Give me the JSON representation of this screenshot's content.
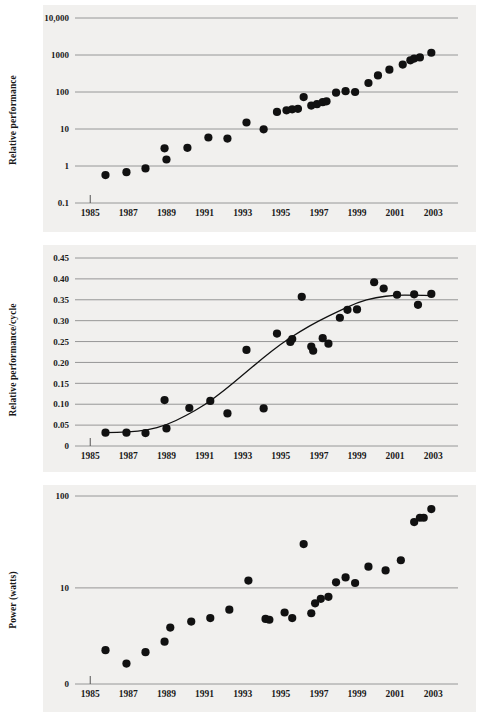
{
  "figure": {
    "background": "#ffffff",
    "panel_background": "#f1f0ee",
    "grid_color": "#8c8c8c",
    "marker_color": "#111111",
    "curve_color": "#111111",
    "panels": 3
  },
  "chart_data": [
    {
      "id": "relative-performance",
      "type": "scatter",
      "title": "",
      "xlabel": "",
      "ylabel": "Relative performance",
      "yscale": "log",
      "ylim": [
        0.1,
        10000
      ],
      "xlim": [
        1984.2,
        2004.3
      ],
      "grid": true,
      "legend": null,
      "ytick_labels": [
        "10,000",
        "1000",
        "100",
        "10",
        "1",
        "0.1"
      ],
      "ytick_values": [
        10000,
        1000,
        100,
        10,
        1,
        0.1
      ],
      "xtick_labels": [
        "1985",
        "1987",
        "1989",
        "1991",
        "1993",
        "1995",
        "1997",
        "1999",
        "2001",
        "2003"
      ],
      "xtick_values": [
        1985,
        1987,
        1989,
        1991,
        1993,
        1995,
        1997,
        1999,
        2001,
        2003
      ],
      "x": [
        1985.8,
        1986.9,
        1987.9,
        1988.9,
        1989.0,
        1990.1,
        1991.2,
        1992.2,
        1993.2,
        1994.1,
        1994.8,
        1995.3,
        1995.6,
        1995.9,
        1996.2,
        1996.6,
        1996.9,
        1997.2,
        1997.4,
        1997.9,
        1998.4,
        1998.9,
        1999.6,
        2000.1,
        2000.7,
        2001.4,
        2001.8,
        2002.0,
        2002.3,
        2002.9
      ],
      "y": [
        0.57,
        0.68,
        0.86,
        3.0,
        1.5,
        3.1,
        5.9,
        5.5,
        15.0,
        9.8,
        29.0,
        32.0,
        34.0,
        35.0,
        73.0,
        43.0,
        47.0,
        53.0,
        56.0,
        96.0,
        105.0,
        100.0,
        175.0,
        280.0,
        400.0,
        550.0,
        720.0,
        800.0,
        860.0,
        1150.0
      ]
    },
    {
      "id": "relative-performance-per-cycle",
      "type": "scatter",
      "title": "",
      "xlabel": "",
      "ylabel": "Relative performance/cycle",
      "yscale": "linear",
      "ylim": [
        0,
        0.45
      ],
      "xlim": [
        1984.2,
        2004.3
      ],
      "grid": true,
      "legend": null,
      "ytick_labels": [
        "0.45",
        "0.40",
        "0.35",
        "0.30",
        "0.25",
        "0.20",
        "0.15",
        "0.10",
        "0.05",
        "0"
      ],
      "ytick_values": [
        0.45,
        0.4,
        0.35,
        0.3,
        0.25,
        0.2,
        0.15,
        0.1,
        0.05,
        0
      ],
      "xtick_labels": [
        "1985",
        "1987",
        "1989",
        "1991",
        "1993",
        "1995",
        "1997",
        "1999",
        "2001",
        "2003"
      ],
      "xtick_values": [
        1985,
        1987,
        1989,
        1991,
        1993,
        1995,
        1997,
        1999,
        2001,
        2003
      ],
      "x": [
        1985.8,
        1986.9,
        1987.9,
        1988.9,
        1989.0,
        1990.2,
        1991.3,
        1992.2,
        1993.2,
        1994.1,
        1994.8,
        1995.5,
        1995.6,
        1996.1,
        1996.6,
        1996.7,
        1997.2,
        1997.5,
        1998.1,
        1998.5,
        1999.0,
        1999.9,
        2000.4,
        2001.1,
        2002.0,
        2002.2,
        2002.9
      ],
      "y": [
        0.032,
        0.032,
        0.031,
        0.11,
        0.042,
        0.091,
        0.108,
        0.078,
        0.23,
        0.09,
        0.269,
        0.249,
        0.256,
        0.357,
        0.238,
        0.228,
        0.258,
        0.245,
        0.307,
        0.326,
        0.327,
        0.392,
        0.377,
        0.362,
        0.363,
        0.338,
        0.364
      ],
      "fit_curve": {
        "name": "sigmoid-trend",
        "x": [
          1985.8,
          1987.0,
          1988.0,
          1989.0,
          1990.0,
          1991.0,
          1992.0,
          1993.0,
          1994.0,
          1995.0,
          1996.0,
          1997.0,
          1998.0,
          1999.0,
          2000.0,
          2001.0,
          2002.0,
          2003.0
        ],
        "y": [
          0.032,
          0.033,
          0.038,
          0.05,
          0.072,
          0.098,
          0.132,
          0.17,
          0.208,
          0.244,
          0.274,
          0.3,
          0.322,
          0.343,
          0.356,
          0.361,
          0.361,
          0.36
        ]
      }
    },
    {
      "id": "power-watts",
      "type": "scatter",
      "title": "",
      "xlabel": "",
      "ylabel": "Power (watts)",
      "yscale": "log",
      "ylim": [
        0.9,
        100
      ],
      "xlim": [
        1984.2,
        2004.3
      ],
      "grid": true,
      "legend": null,
      "ytick_labels": [
        "100",
        "10",
        "0"
      ],
      "ytick_values": [
        100,
        10,
        0.9
      ],
      "xtick_labels": [
        "1985",
        "1987",
        "1989",
        "1991",
        "1993",
        "1995",
        "1997",
        "1999",
        "2001",
        "2003"
      ],
      "xtick_values": [
        1985,
        1987,
        1989,
        1991,
        1993,
        1995,
        1997,
        1999,
        2001,
        2003
      ],
      "x": [
        1985.8,
        1986.9,
        1987.9,
        1988.9,
        1989.2,
        1990.3,
        1991.3,
        1992.3,
        1993.3,
        1994.2,
        1994.4,
        1995.2,
        1995.6,
        1996.2,
        1996.6,
        1996.8,
        1997.1,
        1997.5,
        1997.9,
        1998.4,
        1998.9,
        1999.6,
        2000.5,
        2001.3,
        2002.0,
        2002.3,
        2002.5,
        2002.9
      ],
      "y": [
        2.1,
        1.5,
        2.0,
        2.6,
        3.7,
        4.3,
        4.7,
        5.8,
        12.0,
        4.6,
        4.5,
        5.4,
        4.7,
        30.0,
        5.3,
        6.8,
        7.6,
        8.0,
        11.5,
        13.0,
        11.3,
        17.0,
        15.5,
        20.0,
        52.0,
        58.0,
        58.0,
        72.0
      ]
    }
  ]
}
